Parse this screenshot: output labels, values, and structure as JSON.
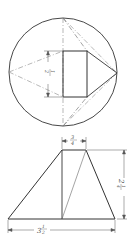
{
  "figure": {
    "top_view": {
      "label": "plan view",
      "dimension_height": {
        "whole": "",
        "num": "1",
        "den": "2",
        "text": "1/2"
      }
    },
    "front_view": {
      "label": "elevation view",
      "dimension_top_width": {
        "num": "3",
        "den": "4",
        "text": "3/4"
      },
      "dimension_height": {
        "whole": "2",
        "num": "1",
        "den": "4",
        "text": "2 1/4"
      },
      "dimension_base_width": {
        "whole": "3",
        "num": "1",
        "den": "2",
        "text": "3 1/2"
      }
    },
    "colors": {
      "line": "#333333",
      "center_line": "#888888",
      "dim_line": "#555555"
    }
  }
}
